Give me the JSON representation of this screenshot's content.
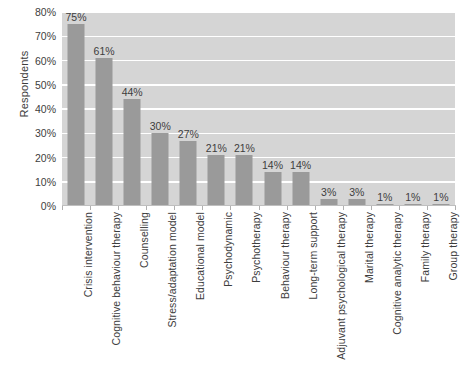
{
  "chart_data": {
    "type": "bar",
    "title": "",
    "xlabel": "",
    "ylabel": "Respondents",
    "ylim": [
      0,
      80
    ],
    "ytick_labels": [
      "0%",
      "10%",
      "20%",
      "30%",
      "40%",
      "50%",
      "60%",
      "70%",
      "80%"
    ],
    "ytick_values": [
      0,
      10,
      20,
      30,
      40,
      50,
      60,
      70,
      80
    ],
    "grid": true,
    "legend": "none",
    "categories": [
      "Crisis intervention",
      "Cognitive behaviour therapy",
      "Counselling",
      "Stress/adaptation model",
      "Educational model",
      "Psychodynamic",
      "Psychotherapy",
      "Behaviour therapy",
      "Long-term support",
      "Adjuvant psychological therapy",
      "Marital therapy",
      "Cognitive analytic therapy",
      "Family therapy",
      "Group therapy"
    ],
    "values": [
      75,
      61,
      44,
      30,
      27,
      21,
      21,
      14,
      14,
      3,
      3,
      1,
      1,
      1
    ],
    "value_labels": [
      "75%",
      "61%",
      "44%",
      "30%",
      "27%",
      "21%",
      "21%",
      "14%",
      "14%",
      "3%",
      "3%",
      "1%",
      "1%",
      "1%"
    ],
    "colors": {
      "bar": "#9a9a9a",
      "plot_background": "#d5d5d5",
      "gridline": "#ffffff",
      "text": "#3d3d3d",
      "page_background": "#ffffff"
    }
  }
}
